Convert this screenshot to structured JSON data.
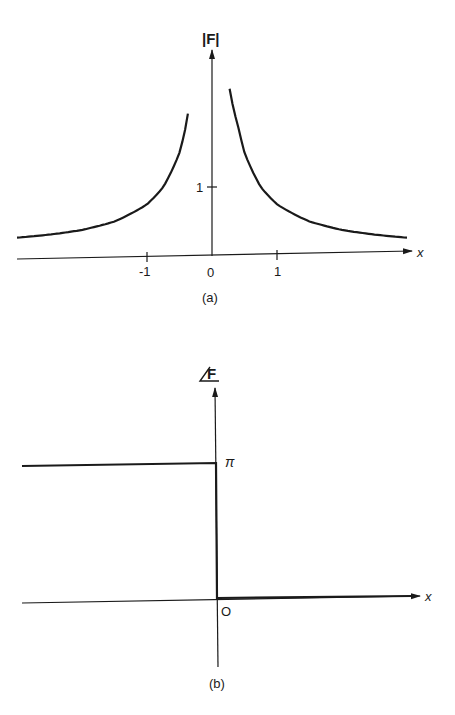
{
  "figure": {
    "panel_a": {
      "caption": "(a)",
      "ylabel": "|F|",
      "xlabel": "x",
      "xticks": [
        "-1",
        "0",
        "1"
      ],
      "yticks": [
        "1"
      ]
    },
    "panel_b": {
      "caption": "(b)",
      "ylabel": "/F",
      "xlabel": "x",
      "origin_label": "O",
      "level_label": "π"
    }
  },
  "chart_data": [
    {
      "type": "line",
      "title": "(a) Magnitude |F| vs x",
      "xlabel": "x",
      "ylabel": "|F|",
      "xticks": [
        -1,
        0,
        1
      ],
      "yticks": [
        1
      ],
      "xlim": [
        -3.0,
        3.0
      ],
      "ylim": [
        0,
        3.0
      ],
      "grid": false,
      "legend": null,
      "annotations": [
        "|F| grows without bound as x → 0 (vertical asymptote at x = 0)"
      ],
      "series": [
        {
          "name": "|F| (x<0)",
          "x": [
            -3.0,
            -2.5,
            -2.0,
            -1.5,
            -1.0,
            -0.75,
            -0.5,
            -0.4,
            -0.37
          ],
          "y": [
            0.28,
            0.32,
            0.38,
            0.5,
            0.75,
            1.0,
            1.5,
            1.9,
            2.1
          ]
        },
        {
          "name": "|F| (x>0)",
          "x": [
            0.27,
            0.4,
            0.5,
            0.75,
            1.0,
            1.5,
            2.0,
            2.5,
            3.0
          ],
          "y": [
            2.1,
            1.9,
            1.5,
            1.0,
            0.75,
            0.5,
            0.38,
            0.32,
            0.28
          ]
        }
      ]
    },
    {
      "type": "line",
      "title": "(b) Phase /F vs x",
      "xlabel": "x",
      "ylabel": "/F",
      "yticks_labels": [
        "π"
      ],
      "xticks_labels": [
        "O"
      ],
      "grid": false,
      "legend": null,
      "annotations": [
        "Phase equals π for x < 0 and 0 for x > 0 (step at x = 0)"
      ],
      "series": [
        {
          "name": "/F",
          "x": [
            -3.0,
            0,
            0,
            3.0
          ],
          "y": [
            3.14159,
            3.14159,
            0,
            0
          ]
        }
      ]
    }
  ]
}
